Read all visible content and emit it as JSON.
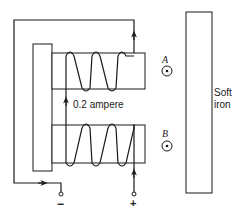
{
  "figure": {
    "current_label": "0.2 ampere",
    "point_a_label": "A",
    "point_b_label": "B",
    "soft_iron_label_line1": "Soft",
    "soft_iron_label_line2": "iron",
    "negative_terminal_label": "−",
    "positive_terminal_label": "+",
    "field_direction_symbol": "out-of-page-dot"
  },
  "colors": {
    "line": "#1a1a1a",
    "background": "#ffffff"
  }
}
